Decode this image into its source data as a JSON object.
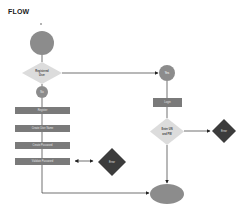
{
  "title": "FLOW",
  "colors": {
    "process_box": "#7a7a7a",
    "start_end": "#8c8c8c",
    "decision": "#dcdcdc",
    "error": "#3c3c3c",
    "line": "#333333"
  },
  "nodes": {
    "start": {
      "label": ""
    },
    "registered_decision": {
      "label_line1": "Registered",
      "label_line2": "User"
    },
    "no": {
      "label": "No"
    },
    "yes": {
      "label": "Yes"
    },
    "register": {
      "label": "Register"
    },
    "create_user_name": {
      "label": "Create User Name"
    },
    "create_password": {
      "label": "Create Password"
    },
    "validate_password": {
      "label": "Validate Password"
    },
    "error_left": {
      "label": "Error"
    },
    "login": {
      "label": "Login"
    },
    "enter_decision": {
      "label_line1": "Enter UN",
      "label_line2": "and PW"
    },
    "error_right": {
      "label": "Error"
    },
    "end": {
      "label": ""
    }
  }
}
